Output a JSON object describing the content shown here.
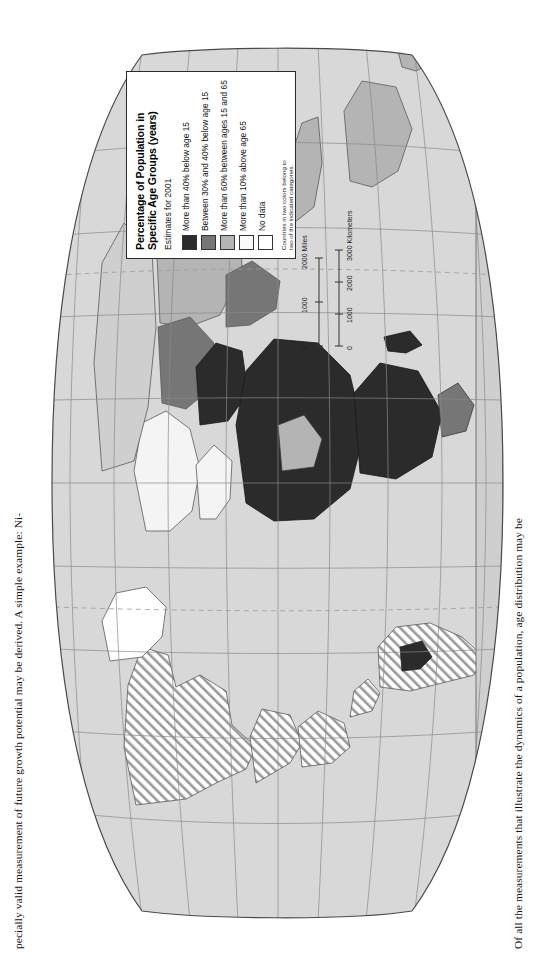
{
  "figure": {
    "type": "choropleth-world-map",
    "projection": "oval (Robinson-like) world projection",
    "orientation": "page scanned rotated 90 degrees"
  },
  "legend": {
    "title": "Percentage of Population in Specific Age Groups (years)",
    "title_line1": "Percentage of Population in",
    "title_line2": "Specific Age Groups (years)",
    "subtitle": "Estimates for 2001",
    "note": "Countries in two colors belong to two of the indicated categories.",
    "items": [
      {
        "label": "More than 40% below age 15",
        "color": "#2b2b2b",
        "swatch": "solid"
      },
      {
        "label": "Between 30% and 40% below age 15",
        "color": "#767676",
        "swatch": "solid"
      },
      {
        "label": "More than 60% between ages 15 and 65",
        "color": "#b4b4b4",
        "swatch": "solid"
      },
      {
        "label": "More than 10% above age 65",
        "color": "#fafafa",
        "swatch": "solid"
      },
      {
        "label": "No data",
        "color": "#ffffff",
        "swatch": "solid"
      }
    ]
  },
  "scalebar": {
    "miles_unit": "2000 Miles",
    "km_unit": "3000 Kilometers",
    "miles_ticks": [
      "0",
      "1000",
      "2000"
    ],
    "km_ticks": [
      "0",
      "1000",
      "2000",
      "3000"
    ]
  },
  "body_text": {
    "top_line": "pecially valid measurement of future growth potential may be derived. A simple example: Ni-",
    "bottom_line": "Of all the measurements that illustrate the dynamics of a population, age distribution may be"
  },
  "colors": {
    "ocean": "#d8d8d8",
    "land_default": "#cfcfcf",
    "graticule": "#8a8a8a",
    "outline": "#5a5a5a",
    "cat_dark": "#2b2b2b",
    "cat_mid": "#767676",
    "cat_light": "#b4b4b4",
    "cat_white": "#fbfbfb",
    "page": "#ffffff"
  },
  "map_regions": [
    {
      "name": "africa-sub-saharan",
      "category": "More than 40% below age 15",
      "color": "#2b2b2b"
    },
    {
      "name": "middle-east",
      "category": "More than 40% below age 15",
      "color": "#2b2b2b"
    },
    {
      "name": "central-asia",
      "category": "Between 30% and 40% below age 15",
      "color": "#767676"
    },
    {
      "name": "south-asia",
      "category": "Between 30% and 40% below age 15",
      "color": "#767676"
    },
    {
      "name": "china-east-asia",
      "category": "More than 60% between ages 15 and 65",
      "color": "#b4b4b4"
    },
    {
      "name": "europe",
      "category": "More than 10% above age 65",
      "color": "#fafafa"
    },
    {
      "name": "north-america",
      "category": "More than 10% above age 65",
      "color": "#fafafa"
    },
    {
      "name": "australia",
      "category": "More than 60% between ages 15 and 65",
      "color": "#b4b4b4"
    },
    {
      "name": "greenland",
      "category": "No data",
      "color": "#ffffff"
    }
  ]
}
